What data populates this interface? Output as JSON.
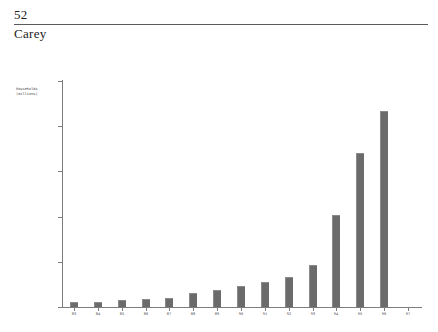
{
  "page": {
    "folio": "52",
    "running_title": "Carey"
  },
  "chart_data": {
    "type": "bar",
    "title": "",
    "xlabel": "",
    "ylabel": "Households\n(millions)",
    "ylabel_lines": [
      "Households",
      "(millions)"
    ],
    "categories": [
      "83",
      "84",
      "85",
      "86",
      "87",
      "88",
      "89",
      "90",
      "91",
      "92",
      "93",
      "94",
      "95",
      "96",
      "97"
    ],
    "values": [
      0.5,
      0.6,
      0.8,
      0.9,
      1.0,
      1.5,
      1.9,
      2.3,
      2.8,
      3.3,
      4.7,
      10.2,
      17.0,
      21.7,
      0
    ],
    "ylim": [
      0,
      25
    ],
    "yticks": [
      0,
      5,
      10,
      15,
      20,
      25
    ],
    "ytick_labels": [
      "0",
      "5",
      "10",
      "15",
      "20",
      "25"
    ],
    "grid": false,
    "legend": false,
    "bar_color": "#6b6b6b",
    "axis_color": "#7d7d7d"
  }
}
